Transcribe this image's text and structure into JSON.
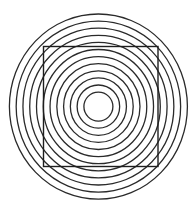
{
  "figure": {
    "background": "#ffffff",
    "stroke_color": "#2a2a2a",
    "center": {
      "x": 98.4,
      "y": 106.6
    },
    "rings": {
      "count": 12,
      "inner_rx": 14.5,
      "inner_ry": 14.5,
      "outer_rx": 89.0,
      "outer_ry": 92.6
    },
    "square": {
      "x": 43.5,
      "y": 46.5,
      "width": 114.5,
      "height": 120.0
    }
  }
}
